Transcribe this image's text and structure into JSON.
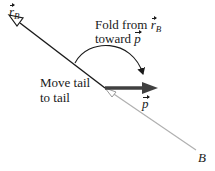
{
  "diagram": {
    "labels": {
      "rB_symbol": "r",
      "rB_subscript": "B",
      "fold_line1_prefix": "Fold from ",
      "fold_line1_symbol": "r",
      "fold_line1_subscript": "B",
      "fold_line2_prefix": "toward ",
      "fold_line2_symbol": "p",
      "move_line1": "Move tail",
      "move_line2": "to tail",
      "p_symbol": "p",
      "point_B": "B"
    },
    "colors": {
      "dark_line": "#1a1a1a",
      "gray_line": "#b0b0b0",
      "p_arrow": "#404040"
    },
    "geometry": {
      "rB_vector": {
        "from": [
          105,
          88
        ],
        "to": [
          10,
          15
        ]
      },
      "original_rB_line": {
        "from": [
          105,
          88
        ],
        "to": [
          196,
          150
        ]
      },
      "p_vector": {
        "from": [
          105,
          88
        ],
        "to": [
          157,
          88
        ]
      },
      "fold_arc": {
        "start": [
          75,
          63
        ],
        "end": [
          144,
          80
        ]
      }
    }
  }
}
